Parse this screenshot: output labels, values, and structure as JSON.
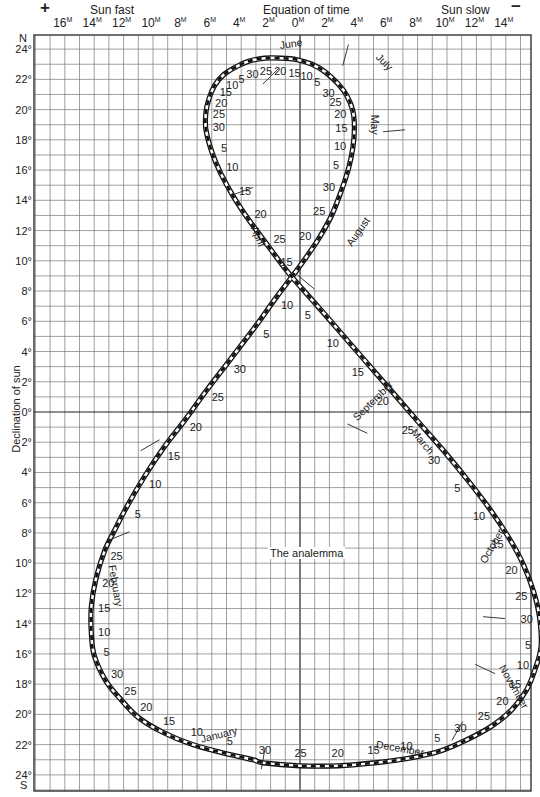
{
  "chart_data": {
    "type": "line",
    "title": "The analemma",
    "top_title": "Equation of time",
    "top_left_label": "Sun fast",
    "top_right_label": "Sun slow",
    "plus_sign": "+",
    "minus_sign": "−",
    "xlabel": "Equation of time (minutes)",
    "ylabel": "Declination of sun",
    "north_label": "N",
    "south_label": "S",
    "minute_suffix": "M",
    "x_ticks": [
      {
        "label": "16",
        "value": 16
      },
      {
        "label": "14",
        "value": 14
      },
      {
        "label": "12",
        "value": 12
      },
      {
        "label": "10",
        "value": 10
      },
      {
        "label": "8",
        "value": 8
      },
      {
        "label": "6",
        "value": 6
      },
      {
        "label": "4",
        "value": 4
      },
      {
        "label": "2",
        "value": 2
      },
      {
        "label": "0",
        "value": 0
      },
      {
        "label": "2",
        "value": -2
      },
      {
        "label": "4",
        "value": -4
      },
      {
        "label": "6",
        "value": -6
      },
      {
        "label": "8",
        "value": -8
      },
      {
        "label": "10",
        "value": -10
      },
      {
        "label": "12",
        "value": -12
      },
      {
        "label": "14",
        "value": -14
      }
    ],
    "y_ticks": [
      {
        "label": "24°",
        "value": 24
      },
      {
        "label": "22°",
        "value": 22
      },
      {
        "label": "20°",
        "value": 20
      },
      {
        "label": "18°",
        "value": 18
      },
      {
        "label": "16°",
        "value": 16
      },
      {
        "label": "14°",
        "value": 14
      },
      {
        "label": "12°",
        "value": 12
      },
      {
        "label": "10°",
        "value": 10
      },
      {
        "label": "8°",
        "value": 8
      },
      {
        "label": "6°",
        "value": 6
      },
      {
        "label": "4°",
        "value": 4
      },
      {
        "label": "2°",
        "value": 2
      },
      {
        "label": "0°",
        "value": 0
      },
      {
        "label": "2°",
        "value": -2
      },
      {
        "label": "4°",
        "value": -4
      },
      {
        "label": "6°",
        "value": -6
      },
      {
        "label": "8°",
        "value": -8
      },
      {
        "label": "10°",
        "value": -10
      },
      {
        "label": "12°",
        "value": -12
      },
      {
        "label": "14°",
        "value": -14
      },
      {
        "label": "16°",
        "value": -16
      },
      {
        "label": "18°",
        "value": -18
      },
      {
        "label": "20°",
        "value": -20
      },
      {
        "label": "22°",
        "value": -22
      },
      {
        "label": "24°",
        "value": -24
      }
    ],
    "xlim": [
      18,
      -16
    ],
    "ylim": [
      -25,
      25
    ],
    "grid": true,
    "grid_step_x_minutes": 1,
    "grid_step_y_degrees": 1,
    "note": "x = equation of time in minutes (positive = sun fast, plotted left); y = solar declination in degrees (north positive)",
    "points": [
      {
        "month": "January",
        "day": 1,
        "eot": 3.2,
        "dec": -23.0,
        "label": ""
      },
      {
        "month": "January",
        "day": 5,
        "eot": 5.0,
        "dec": -22.6,
        "label": "5"
      },
      {
        "month": "January",
        "day": 10,
        "eot": 7.3,
        "dec": -22.0,
        "label": "10"
      },
      {
        "month": "January",
        "day": 15,
        "eot": 9.3,
        "dec": -21.2,
        "label": "15"
      },
      {
        "month": "January",
        "day": 20,
        "eot": 11.0,
        "dec": -20.2,
        "label": "20"
      },
      {
        "month": "January",
        "day": 25,
        "eot": 12.2,
        "dec": -19.0,
        "label": "25"
      },
      {
        "month": "January",
        "day": 30,
        "eot": 13.2,
        "dec": -17.8,
        "label": "30"
      },
      {
        "month": "February",
        "day": 5,
        "eot": 14.0,
        "dec": -16.1,
        "label": "5"
      },
      {
        "month": "February",
        "day": 10,
        "eot": 14.2,
        "dec": -14.6,
        "label": "10"
      },
      {
        "month": "February",
        "day": 15,
        "eot": 14.2,
        "dec": -12.9,
        "label": "15"
      },
      {
        "month": "February",
        "day": 20,
        "eot": 13.9,
        "dec": -11.1,
        "label": "20"
      },
      {
        "month": "February",
        "day": 25,
        "eot": 13.3,
        "dec": -9.2,
        "label": "25"
      },
      {
        "month": "March",
        "day": 1,
        "eot": 12.6,
        "dec": -7.8,
        "label": ""
      },
      {
        "month": "March",
        "day": 5,
        "eot": 11.8,
        "dec": -6.3,
        "label": "5"
      },
      {
        "month": "March",
        "day": 10,
        "eot": 10.6,
        "dec": -4.3,
        "label": "10"
      },
      {
        "month": "March",
        "day": 15,
        "eot": 9.3,
        "dec": -2.4,
        "label": "15"
      },
      {
        "month": "March",
        "day": 20,
        "eot": 7.8,
        "dec": -0.5,
        "label": "20"
      },
      {
        "month": "March",
        "day": 25,
        "eot": 6.3,
        "dec": 1.5,
        "label": "25"
      },
      {
        "month": "March",
        "day": 30,
        "eot": 4.8,
        "dec": 3.4,
        "label": "30"
      },
      {
        "month": "April",
        "day": 5,
        "eot": 3.0,
        "dec": 5.7,
        "label": "5"
      },
      {
        "month": "April",
        "day": 10,
        "eot": 1.6,
        "dec": 7.6,
        "label": "10"
      },
      {
        "month": "April",
        "day": 15,
        "eot": 0.2,
        "dec": 9.4,
        "label": "15"
      },
      {
        "month": "April",
        "day": 20,
        "eot": -1.1,
        "dec": 11.2,
        "label": "20"
      },
      {
        "month": "April",
        "day": 25,
        "eot": -2.1,
        "dec": 12.9,
        "label": "25"
      },
      {
        "month": "April",
        "day": 30,
        "eot": -2.8,
        "dec": 14.6,
        "label": "30"
      },
      {
        "month": "May",
        "day": 5,
        "eot": -3.3,
        "dec": 16.1,
        "label": "5"
      },
      {
        "month": "May",
        "day": 10,
        "eot": -3.6,
        "dec": 17.5,
        "label": "10"
      },
      {
        "month": "May",
        "day": 15,
        "eot": -3.7,
        "dec": 18.8,
        "label": "15"
      },
      {
        "month": "May",
        "day": 20,
        "eot": -3.6,
        "dec": 19.9,
        "label": "20"
      },
      {
        "month": "May",
        "day": 25,
        "eot": -3.2,
        "dec": 20.9,
        "label": "25"
      },
      {
        "month": "May",
        "day": 30,
        "eot": -2.6,
        "dec": 21.7,
        "label": "30"
      },
      {
        "month": "June",
        "day": 5,
        "eot": -1.7,
        "dec": 22.5,
        "label": "5"
      },
      {
        "month": "June",
        "day": 10,
        "eot": -0.8,
        "dec": 23.0,
        "label": "10"
      },
      {
        "month": "June",
        "day": 15,
        "eot": 0.2,
        "dec": 23.3,
        "label": "15"
      },
      {
        "month": "June",
        "day": 20,
        "eot": 1.3,
        "dec": 23.4,
        "label": "20"
      },
      {
        "month": "June",
        "day": 25,
        "eot": 2.4,
        "dec": 23.4,
        "label": "25"
      },
      {
        "month": "June",
        "day": 30,
        "eot": 3.5,
        "dec": 23.2,
        "label": "30"
      },
      {
        "month": "July",
        "day": 5,
        "eot": 4.4,
        "dec": 22.8,
        "label": "5"
      },
      {
        "month": "July",
        "day": 10,
        "eot": 5.2,
        "dec": 22.3,
        "label": "10"
      },
      {
        "month": "July",
        "day": 15,
        "eot": 5.8,
        "dec": 21.6,
        "label": "15"
      },
      {
        "month": "July",
        "day": 20,
        "eot": 6.2,
        "dec": 20.7,
        "label": "20"
      },
      {
        "month": "July",
        "day": 25,
        "eot": 6.4,
        "dec": 19.8,
        "label": "25"
      },
      {
        "month": "July",
        "day": 30,
        "eot": 6.4,
        "dec": 18.7,
        "label": "30"
      },
      {
        "month": "August",
        "day": 5,
        "eot": 6.0,
        "dec": 17.2,
        "label": "5"
      },
      {
        "month": "August",
        "day": 10,
        "eot": 5.4,
        "dec": 15.8,
        "label": "10"
      },
      {
        "month": "August",
        "day": 15,
        "eot": 4.5,
        "dec": 14.2,
        "label": "15"
      },
      {
        "month": "August",
        "day": 20,
        "eot": 3.4,
        "dec": 12.6,
        "label": "20"
      },
      {
        "month": "August",
        "day": 25,
        "eot": 2.1,
        "dec": 10.9,
        "label": "25"
      },
      {
        "month": "August",
        "day": 30,
        "eot": 0.7,
        "dec": 9.1,
        "label": ""
      },
      {
        "month": "September",
        "day": 5,
        "eot": -1.2,
        "dec": 7.0,
        "label": "5"
      },
      {
        "month": "September",
        "day": 10,
        "eot": -2.9,
        "dec": 5.1,
        "label": "10"
      },
      {
        "month": "September",
        "day": 15,
        "eot": -4.6,
        "dec": 3.2,
        "label": "15"
      },
      {
        "month": "September",
        "day": 20,
        "eot": -6.3,
        "dec": 1.3,
        "label": "20"
      },
      {
        "month": "September",
        "day": 25,
        "eot": -8.0,
        "dec": -0.6,
        "label": "25"
      },
      {
        "month": "September",
        "day": 30,
        "eot": -9.8,
        "dec": -2.6,
        "label": "30"
      },
      {
        "month": "October",
        "day": 5,
        "eot": -11.4,
        "dec": -4.5,
        "label": "5"
      },
      {
        "month": "October",
        "day": 10,
        "eot": -12.9,
        "dec": -6.4,
        "label": "10"
      },
      {
        "month": "October",
        "day": 15,
        "eot": -14.2,
        "dec": -8.3,
        "label": "15"
      },
      {
        "month": "October",
        "day": 20,
        "eot": -15.2,
        "dec": -10.1,
        "label": "20"
      },
      {
        "month": "October",
        "day": 25,
        "eot": -15.9,
        "dec": -11.9,
        "label": "25"
      },
      {
        "month": "October",
        "day": 30,
        "eot": -16.3,
        "dec": -13.6,
        "label": "30"
      },
      {
        "month": "November",
        "day": 5,
        "eot": -16.4,
        "dec": -15.5,
        "label": "5"
      },
      {
        "month": "November",
        "day": 10,
        "eot": -16.0,
        "dec": -17.0,
        "label": "10"
      },
      {
        "month": "November",
        "day": 15,
        "eot": -15.4,
        "dec": -18.4,
        "label": "15"
      },
      {
        "month": "November",
        "day": 20,
        "eot": -14.4,
        "dec": -19.7,
        "label": "20"
      },
      {
        "month": "November",
        "day": 25,
        "eot": -13.0,
        "dec": -20.8,
        "label": "25"
      },
      {
        "month": "November",
        "day": 30,
        "eot": -11.3,
        "dec": -21.7,
        "label": "30"
      },
      {
        "month": "December",
        "day": 5,
        "eot": -9.6,
        "dec": -22.4,
        "label": "5"
      },
      {
        "month": "December",
        "day": 10,
        "eot": -7.4,
        "dec": -22.9,
        "label": "10"
      },
      {
        "month": "December",
        "day": 15,
        "eot": -5.1,
        "dec": -23.2,
        "label": "15"
      },
      {
        "month": "December",
        "day": 20,
        "eot": -2.6,
        "dec": -23.4,
        "label": "20"
      },
      {
        "month": "December",
        "day": 25,
        "eot": 0.0,
        "dec": -23.4,
        "label": "25"
      },
      {
        "month": "December",
        "day": 30,
        "eot": 2.5,
        "dec": -23.2,
        "label": "30"
      }
    ],
    "month_labels": [
      {
        "text": "June",
        "eot": 0.6,
        "dec": 24.3,
        "rotate": -8
      },
      {
        "text": "July",
        "eot": -5.7,
        "dec": 23.1,
        "rotate": 45
      },
      {
        "text": "May",
        "eot": -5.0,
        "dec": 19.0,
        "rotate": 90
      },
      {
        "text": "April",
        "eot": 2.9,
        "dec": 11.6,
        "rotate": 68
      },
      {
        "text": "August",
        "eot": -4.0,
        "dec": 11.9,
        "rotate": -55
      },
      {
        "text": "September",
        "eot": -5.0,
        "dec": 0.7,
        "rotate": -45
      },
      {
        "text": "March",
        "eot": -8.3,
        "dec": -2.0,
        "rotate": 50
      },
      {
        "text": "October",
        "eot": -13.1,
        "dec": -8.9,
        "rotate": -60
      },
      {
        "text": "February",
        "eot": 12.6,
        "dec": -11.5,
        "rotate": 80
      },
      {
        "text": "November",
        "eot": -14.5,
        "dec": -18.2,
        "rotate": 60
      },
      {
        "text": "December",
        "eot": -6.8,
        "dec": -22.3,
        "rotate": 10
      },
      {
        "text": "January",
        "eot": 5.5,
        "dec": -21.4,
        "rotate": -14
      }
    ],
    "month_ticks": [
      {
        "eot": 2.0,
        "dec": 22.2,
        "angle": -45
      },
      {
        "eot": -3.1,
        "dec": 23.6,
        "angle": -75
      },
      {
        "eot": -6.4,
        "dec": 18.6,
        "angle": -5
      },
      {
        "eot": 3.9,
        "dec": 14.6,
        "angle": -20
      },
      {
        "eot": -0.4,
        "dec": 8.6,
        "angle": 40
      },
      {
        "eot": -3.9,
        "dec": -1.1,
        "angle": 25
      },
      {
        "eot": 10.2,
        "dec": -2.2,
        "angle": -30
      },
      {
        "eot": 12.3,
        "dec": -8.2,
        "angle": -22
      },
      {
        "eot": -13.2,
        "dec": -13.6,
        "angle": 5
      },
      {
        "eot": -10.7,
        "dec": -21.1,
        "angle": -60
      },
      {
        "eot": 2.5,
        "dec": -22.9,
        "angle": -80
      },
      {
        "eot": -12.6,
        "dec": -17.0,
        "angle": 25
      }
    ]
  }
}
